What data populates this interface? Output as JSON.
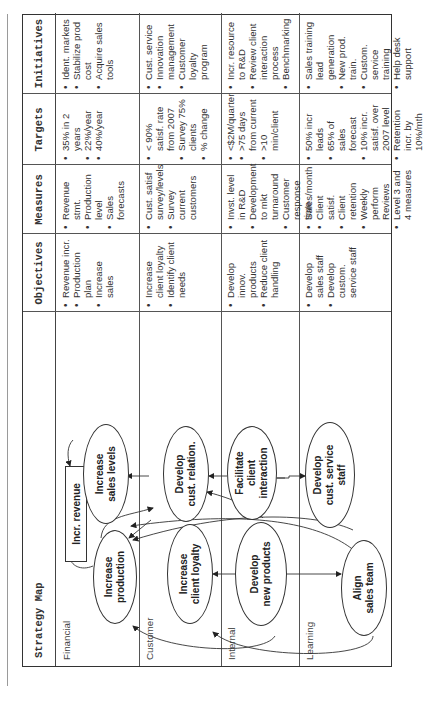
{
  "headers": {
    "strategy_map": "Strategy Map",
    "objectives": "Objectives",
    "measures": "Measures",
    "targets": "Targets",
    "initiatives": "Initiatives"
  },
  "rows": [
    {
      "label": "Financial",
      "objectives": [
        "Revenue incr.",
        "Production plan",
        "Increase sales"
      ],
      "measures": [
        "Revenue stmt.",
        "Production level",
        "Sales forecasts"
      ],
      "targets": [
        "35% in 2 years",
        "22%/year",
        "40%/year"
      ],
      "initiatives": [
        "Ident. markets",
        "Stabilize prod cost",
        "Acquire sales tools"
      ]
    },
    {
      "label": "Customer",
      "objectives": [
        "Increase client loyalty",
        "Identify client needs"
      ],
      "measures": [
        "Cust. satisf survey/levels",
        "Survey current customers"
      ],
      "targets": [
        "< 90% satisf. rate from 2007",
        "Survey 75% clients",
        "% change"
      ],
      "initiatives": [
        "Cust. service",
        "Innovation management",
        "Customer loyalty program"
      ]
    },
    {
      "label": "Internal",
      "objectives": [
        "Develop innov. products",
        "Reduce client handling"
      ],
      "measures": [
        "Invst. level in R&D",
        "Development to mkt turnaround",
        "Customer response time"
      ],
      "targets": [
        "<$2M/quarter",
        ">75 days from current",
        ">10 min/client"
      ],
      "initiatives": [
        "Incr. resource to R&D",
        "Review client interaction process",
        "Benchmarking"
      ]
    },
    {
      "label": "Learning",
      "objectives": [
        "Develop sales staff",
        "Develop custom. service staff"
      ],
      "measures": [
        "Sales/month",
        "Client satisf.",
        "Client retention",
        "Weekly perform Reviews",
        "Level 3 and 4 measures"
      ],
      "targets": [
        "50% incr leads",
        "65% of sales forecast",
        "10% incr. satisf. over 2007 level",
        "Retention incr. by 10%/mth"
      ],
      "initiatives": [
        "Sales training lead generation",
        "New prod. train.",
        "Custom. service training",
        "Help desk support"
      ]
    }
  ],
  "map_nodes": {
    "incr_revenue": "Incr. revenue",
    "increase_production": [
      "Increase",
      "production"
    ],
    "increase_sales_levels": [
      "Increase",
      "sales levels"
    ],
    "increase_client_loyalty": [
      "Increase",
      "client loyalty"
    ],
    "develop_cust_relation": [
      "Develop",
      "cust. relation."
    ],
    "develop_new_products": [
      "Develop",
      "new products"
    ],
    "facilitate_client_interaction": [
      "Facilitate",
      "client",
      "interaction"
    ],
    "align_sales_team": [
      "Align",
      "sales team"
    ],
    "develop_cust_service_staff": [
      "Develop",
      "cust. service",
      "staff"
    ]
  }
}
